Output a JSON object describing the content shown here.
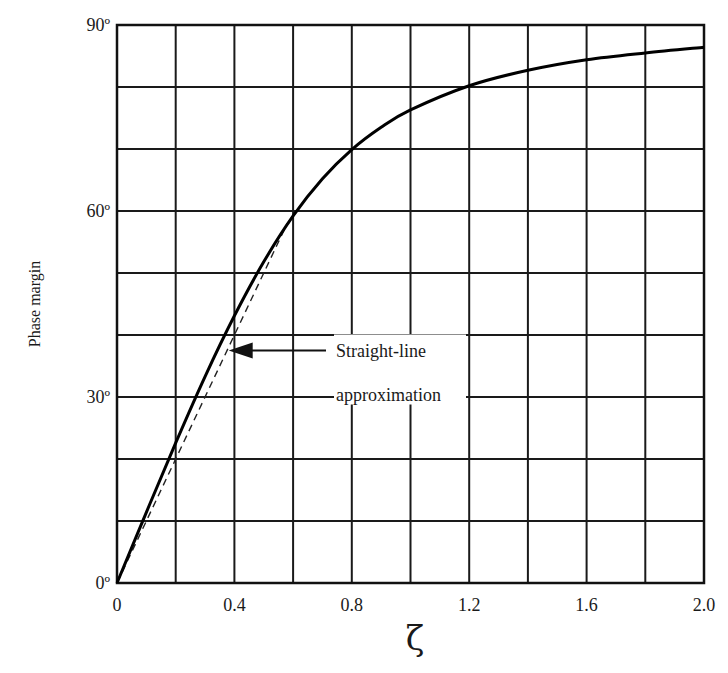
{
  "chart_data": {
    "type": "line",
    "title": "",
    "xlabel": "ζ",
    "ylabel": "Phase margin",
    "xlim": [
      0,
      2.0
    ],
    "ylim": [
      0,
      90
    ],
    "grid": true,
    "x_grid_step": 0.2,
    "y_grid_step": 10,
    "xticks": [
      0,
      0.4,
      0.8,
      1.2,
      1.6,
      2.0
    ],
    "xtick_labels": [
      "0",
      "0.4",
      "0.8",
      "1.2",
      "1.6",
      "2.0"
    ],
    "yticks": [
      0,
      30,
      60,
      90
    ],
    "ytick_labels": [
      "0º",
      "30º",
      "60º",
      "90º"
    ],
    "legend": null,
    "series": [
      {
        "name": "Phase margin",
        "style": "solid",
        "x": [
          0,
          0.1,
          0.2,
          0.3,
          0.4,
          0.5,
          0.6,
          0.7,
          0.8,
          0.9,
          1.0,
          1.2,
          1.4,
          1.6,
          1.8,
          2.0
        ],
        "values": [
          0,
          11.4,
          22.6,
          33.3,
          43.1,
          51.8,
          59.2,
          65.2,
          69.9,
          73.5,
          76.3,
          80.2,
          82.7,
          84.4,
          85.5,
          86.4
        ]
      },
      {
        "name": "Straight-line approximation",
        "style": "dashed",
        "x": [
          0,
          0.58
        ],
        "values": [
          0,
          58
        ]
      }
    ],
    "annotations": [
      {
        "text_lines": [
          "Straight-line",
          "approximation"
        ],
        "arrow_to": [
          0.36,
          37.5
        ],
        "text_at": [
          0.8,
          37.5
        ]
      }
    ]
  }
}
